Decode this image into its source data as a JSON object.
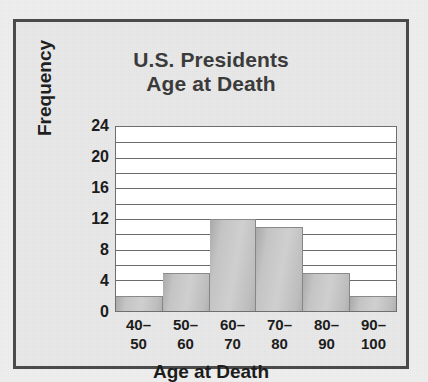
{
  "chart_data": {
    "type": "bar",
    "title": "U.S. Presidents Age at Death",
    "title_lines": [
      "U.S. Presidents",
      "Age at Death"
    ],
    "xlabel": "Age at Death",
    "ylabel": "Frequency",
    "categories": [
      "40–50",
      "50–60",
      "60–70",
      "70–80",
      "80–90",
      "90–100"
    ],
    "category_lines": [
      [
        "40–",
        "50"
      ],
      [
        "50–",
        "60"
      ],
      [
        "60–",
        "70"
      ],
      [
        "70–",
        "80"
      ],
      [
        "80–",
        "90"
      ],
      [
        "90–",
        "100"
      ]
    ],
    "values": [
      2,
      5,
      12,
      11,
      5,
      2
    ],
    "ylim": [
      0,
      24
    ],
    "ytick_labels": [
      "24",
      "20",
      "16",
      "12",
      "8",
      "4",
      "0"
    ],
    "ytick_values": [
      24,
      20,
      16,
      12,
      8,
      4,
      0
    ],
    "gridline_values": [
      2,
      4,
      6,
      8,
      10,
      12,
      14,
      16,
      18,
      20,
      22
    ],
    "grid": true,
    "legend": false,
    "colors": {
      "bar_fill": "#c4c4c4",
      "bar_edge": "#868686",
      "plot_background": "#ffffff",
      "gridline": "#6a6a6a",
      "page_background": "#efefef",
      "frame_border": "#4a4a4a",
      "title_text": "#3b3b3b",
      "label_text": "#1c1c1c"
    }
  }
}
